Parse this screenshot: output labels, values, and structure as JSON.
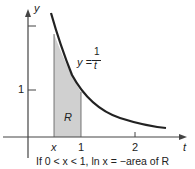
{
  "axes": {
    "x_label": "t",
    "y_label": "y"
  },
  "ticks": {
    "x": [
      "x",
      "1",
      "2"
    ],
    "y": [
      "1"
    ]
  },
  "curve_label": {
    "lhs": "y =",
    "num": "1",
    "den": "t"
  },
  "region_label": "R",
  "caption": "If 0 < x < 1,   ln x = −area of R",
  "colors": {
    "shade": "#d0d0d0",
    "curve": "#222222"
  }
}
